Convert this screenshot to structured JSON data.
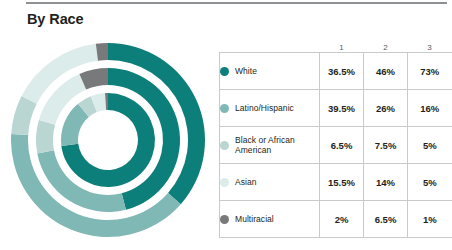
{
  "page_title": "By Race",
  "divider": {
    "name": "top-rule",
    "color": "#8d9194"
  },
  "colors": {
    "white": "#0d7f7b",
    "latino_hispanic": "#7fb8b4",
    "black_or_african_american": "#b9d6d3",
    "asian": "#dceceb",
    "multiracial": "#77797b",
    "table_border": "#c8cacb",
    "header_text": "#58585b",
    "body_text": "#231f20"
  },
  "table": {
    "column_headers": [
      "1",
      "2",
      "3"
    ],
    "rows": [
      {
        "label": "White",
        "color_key": "white",
        "values": [
          "36.5%",
          "46%",
          "73%"
        ]
      },
      {
        "label": "Latino/Hispanic",
        "color_key": "latino_hispanic",
        "values": [
          "39.5%",
          "26%",
          "16%"
        ]
      },
      {
        "label": "Black or African American",
        "color_key": "black_or_african_american",
        "values": [
          "6.5%",
          "7.5%",
          "5%"
        ]
      },
      {
        "label": "Asian",
        "color_key": "asian",
        "values": [
          "15.5%",
          "14%",
          "5%"
        ]
      },
      {
        "label": "Multiracial",
        "color_key": "multiracial",
        "values": [
          "2%",
          "6.5%",
          "1%"
        ]
      }
    ]
  },
  "chart_data": {
    "type": "pie",
    "title": "By Race",
    "variant": "concentric-donut",
    "legend_position": "right-table",
    "categories": [
      "White",
      "Latino/Hispanic",
      "Black or African American",
      "Asian",
      "Multiracial"
    ],
    "category_colors": [
      "#0d7f7b",
      "#7fb8b4",
      "#b9d6d3",
      "#dceceb",
      "#77797b"
    ],
    "series": [
      {
        "name": "1",
        "ring": "outer",
        "values": [
          36.5,
          39.5,
          6.5,
          15.5,
          2.0
        ]
      },
      {
        "name": "2",
        "ring": "middle",
        "values": [
          46.0,
          26.0,
          7.5,
          14.0,
          6.5
        ]
      },
      {
        "name": "3",
        "ring": "inner",
        "values": [
          73.0,
          16.0,
          5.0,
          5.0,
          1.0
        ]
      }
    ],
    "units": "percent",
    "start_angle_deg": 0,
    "direction": "clockwise",
    "center": {
      "x": 108,
      "y": 140
    },
    "rings": [
      {
        "name": "1",
        "outer_radius": 97,
        "inner_radius": 80
      },
      {
        "name": "2",
        "outer_radius": 72,
        "inner_radius": 55
      },
      {
        "name": "3",
        "outer_radius": 47,
        "inner_radius": 30
      }
    ]
  }
}
